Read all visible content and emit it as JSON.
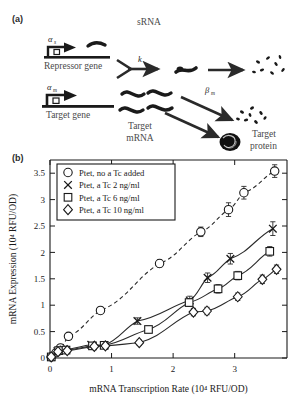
{
  "figure": {
    "panel_a_label": "(a)",
    "panel_b_label": "(b)"
  },
  "diagram": {
    "title": "sRNA",
    "repressor_rate": "α",
    "repressor_rate_sub": "s",
    "repressor_gene": "Repressor gene",
    "k_label": "k",
    "target_rate": "α",
    "target_rate_sub": "m",
    "target_gene": "Target gene",
    "target_mrna_line1": "Target",
    "target_mrna_line2": "mRNA",
    "beta_label": "β",
    "beta_sub": "m",
    "target_protein_line1": "Target",
    "target_protein_line2": "protein"
  },
  "chart_data": {
    "type": "scatter",
    "title": "",
    "xlabel": "mRNA Transcription Rate (10⁴ RFU/OD)",
    "ylabel": "mRNA Expression (10⁴ RFU/OD)",
    "xlim": [
      0,
      3.85
    ],
    "ylim": [
      0,
      3.75
    ],
    "xticks": [
      0,
      1,
      2,
      3
    ],
    "xticklabels": [
      "0",
      "1",
      "2",
      "3"
    ],
    "yticks": [
      0,
      0.5,
      1,
      1.5,
      2,
      2.5,
      3,
      3.5
    ],
    "yticklabels": [
      "0",
      "0.5",
      "1",
      "1.5",
      "2",
      "2.5",
      "3",
      "3.5"
    ],
    "grid": false,
    "legend_position": "top-left",
    "series": [
      {
        "name": "Ptet, no a Tc added",
        "marker": "circle",
        "linestyle": "dashed",
        "points": [
          {
            "x": 0.02,
            "y": 0.02,
            "err": 0.02
          },
          {
            "x": 0.1,
            "y": 0.1,
            "err": 0.03
          },
          {
            "x": 0.17,
            "y": 0.19,
            "err": 0.04
          },
          {
            "x": 0.3,
            "y": 0.41,
            "err": 0.05
          },
          {
            "x": 0.82,
            "y": 0.9,
            "err": 0.06
          },
          {
            "x": 1.78,
            "y": 1.79,
            "err": 0.07
          },
          {
            "x": 2.45,
            "y": 2.39,
            "err": 0.09
          },
          {
            "x": 2.9,
            "y": 2.81,
            "err": 0.13
          },
          {
            "x": 3.15,
            "y": 3.13,
            "err": 0.12
          },
          {
            "x": 3.65,
            "y": 3.54,
            "err": 0.12
          }
        ]
      },
      {
        "name": "Ptet, a Tc 2 ng/ml",
        "marker": "x",
        "linestyle": "solid",
        "points": [
          {
            "x": 0.02,
            "y": 0.02,
            "err": 0.02
          },
          {
            "x": 0.12,
            "y": 0.13,
            "err": 0.03
          },
          {
            "x": 0.22,
            "y": 0.16,
            "err": 0.03
          },
          {
            "x": 0.67,
            "y": 0.25,
            "err": 0.04
          },
          {
            "x": 0.88,
            "y": 0.24,
            "err": 0.04
          },
          {
            "x": 1.42,
            "y": 0.7,
            "err": 0.06
          },
          {
            "x": 2.27,
            "y": 1.09,
            "err": 0.08
          },
          {
            "x": 2.56,
            "y": 1.52,
            "err": 0.09
          },
          {
            "x": 2.93,
            "y": 1.88,
            "err": 0.1
          },
          {
            "x": 3.62,
            "y": 2.45,
            "err": 0.13
          }
        ]
      },
      {
        "name": "Ptet, a Tc 6 ng/ml",
        "marker": "square",
        "linestyle": "solid",
        "points": [
          {
            "x": 0.02,
            "y": 0.02,
            "err": 0.02
          },
          {
            "x": 0.14,
            "y": 0.14,
            "err": 0.03
          },
          {
            "x": 0.26,
            "y": 0.15,
            "err": 0.03
          },
          {
            "x": 0.69,
            "y": 0.23,
            "err": 0.04
          },
          {
            "x": 0.88,
            "y": 0.24,
            "err": 0.04
          },
          {
            "x": 1.6,
            "y": 0.54,
            "err": 0.06
          },
          {
            "x": 2.26,
            "y": 1.05,
            "err": 0.07
          },
          {
            "x": 2.73,
            "y": 1.31,
            "err": 0.08
          },
          {
            "x": 3.05,
            "y": 1.56,
            "err": 0.08
          },
          {
            "x": 3.57,
            "y": 2.02,
            "err": 0.09
          }
        ]
      },
      {
        "name": "Ptet, a Tc 10 ng/ml",
        "marker": "diamond",
        "linestyle": "solid",
        "points": [
          {
            "x": 0.02,
            "y": 0.02,
            "err": 0.02
          },
          {
            "x": 0.13,
            "y": 0.12,
            "err": 0.03
          },
          {
            "x": 0.28,
            "y": 0.14,
            "err": 0.03
          },
          {
            "x": 0.72,
            "y": 0.22,
            "err": 0.04
          },
          {
            "x": 0.9,
            "y": 0.23,
            "err": 0.04
          },
          {
            "x": 1.45,
            "y": 0.29,
            "err": 0.05
          },
          {
            "x": 2.33,
            "y": 0.87,
            "err": 0.07
          },
          {
            "x": 2.55,
            "y": 0.89,
            "err": 0.07
          },
          {
            "x": 3.05,
            "y": 1.16,
            "err": 0.07
          },
          {
            "x": 3.45,
            "y": 1.49,
            "err": 0.08
          },
          {
            "x": 3.68,
            "y": 1.68,
            "err": 0.08
          }
        ]
      }
    ]
  }
}
